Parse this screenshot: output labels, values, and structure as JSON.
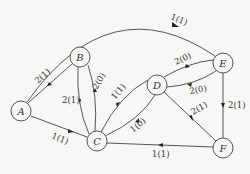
{
  "nodes": [
    {
      "id": "A",
      "label": "A",
      "x": 21,
      "y": 111
    },
    {
      "id": "B",
      "label": "B",
      "x": 80,
      "y": 57
    },
    {
      "id": "C",
      "label": "C",
      "x": 97,
      "y": 141
    },
    {
      "id": "D",
      "label": "D",
      "x": 157,
      "y": 85
    },
    {
      "id": "E",
      "label": "E",
      "x": 223,
      "y": 63
    },
    {
      "id": "F",
      "label": "F",
      "x": 223,
      "y": 148
    }
  ],
  "edges": [
    {
      "from": "A",
      "to": "E",
      "label": "1(1)"
    },
    {
      "from": "A",
      "to": "B",
      "label": "2(1)"
    },
    {
      "from": "A",
      "to": "C",
      "label": "1(1)"
    },
    {
      "from": "B",
      "to": "C",
      "label": "2(1)"
    },
    {
      "from": "C",
      "to": "B",
      "label": "2(0)"
    },
    {
      "from": "D",
      "to": "C",
      "label": "1(1)"
    },
    {
      "from": "C",
      "to": "D",
      "label": "1(0)"
    },
    {
      "from": "D",
      "to": "E",
      "label": "2(0)"
    },
    {
      "from": "E",
      "to": "D",
      "label": "2(0)"
    },
    {
      "from": "E",
      "to": "F",
      "label": "2(1)"
    },
    {
      "from": "D",
      "to": "F",
      "label": "2(1)"
    },
    {
      "from": "F",
      "to": "C",
      "label": "1(1)"
    }
  ]
}
